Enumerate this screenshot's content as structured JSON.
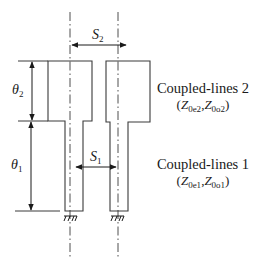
{
  "diagram": {
    "type": "coupled-line layout schematic",
    "dimensions": {
      "theta2": {
        "symbol": "θ",
        "subscript": "2"
      },
      "theta1": {
        "symbol": "θ",
        "subscript": "1"
      },
      "s2": {
        "symbol": "S",
        "subscript": "2"
      },
      "s1": {
        "symbol": "S",
        "subscript": "1"
      }
    },
    "sections": [
      {
        "title": "Coupled-lines 2",
        "impedance_open": "(",
        "z_even": "Z",
        "z_even_sub": "0e2",
        "sep": ",",
        "z_odd": "Z",
        "z_odd_sub": "0o2",
        "impedance_close": ")"
      },
      {
        "title": "Coupled-lines 1",
        "impedance_open": "(",
        "z_even": "Z",
        "z_even_sub": "0e1",
        "sep": ",",
        "z_odd": "Z",
        "z_odd_sub": "0o1",
        "impedance_close": ")"
      }
    ],
    "colors": {
      "line": "#3a3a3a",
      "text": "#1a1a1a",
      "background": "#ffffff"
    }
  }
}
